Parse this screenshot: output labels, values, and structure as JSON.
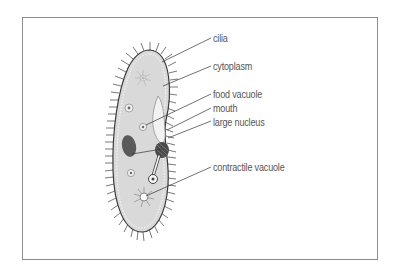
{
  "diagram": {
    "labels": [
      {
        "id": "cilia",
        "text": "cilia"
      },
      {
        "id": "cytoplasm",
        "text": "cytoplasm"
      },
      {
        "id": "food-vacuole",
        "text": "food vacuole"
      },
      {
        "id": "mouth",
        "text": "mouth"
      },
      {
        "id": "large-nucleus",
        "text": "large nucleus"
      },
      {
        "id": "contractile-vacuole",
        "text": "contractile vacuole"
      }
    ],
    "colors": {
      "frame": "#8c8c8c",
      "cell_fill": "#d9d9d9",
      "cilia": "#4a4a4a",
      "nucleus": "#5a5a5a",
      "leader_line": "#333333",
      "label_text": "#555555"
    }
  }
}
